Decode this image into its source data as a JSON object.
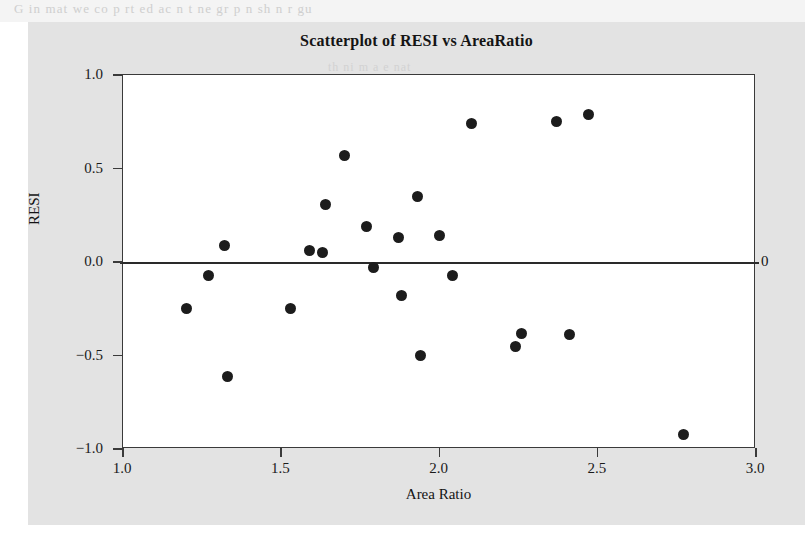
{
  "page": {
    "bleed_text_top": "G  in   mat  we  co  p  rt  ed  ac   n   t  ne  gr  p    n   sh  n   r   gu",
    "panel_ghost_a": "th   ni    m  a   e   nat",
    "panel_ghost_b": "t  h"
  },
  "chart_data": {
    "type": "scatter",
    "title": "Scatterplot of RESI vs AreaRatio",
    "xlabel": "Area Ratio",
    "ylabel": "RESI",
    "xlim": [
      1.0,
      3.0
    ],
    "ylim": [
      -1.0,
      1.0
    ],
    "xticks": [
      1.0,
      1.5,
      2.0,
      2.5,
      3.0
    ],
    "xticklabels": [
      "1.0",
      "1.5",
      "2.0",
      "2.5",
      "3.0"
    ],
    "yticks": [
      1.0,
      0.5,
      0.0,
      -0.5,
      -1.0
    ],
    "yticklabels": [
      "1.0",
      "0.5",
      "0.0",
      "-0.5",
      "-1.0"
    ],
    "grid": false,
    "legend": null,
    "marker_color": "#1c1c1c",
    "marker_size": 11,
    "reference_line": {
      "orientation": "horizontal",
      "y": 0.0,
      "label": "0",
      "label_position": "right",
      "color": "#2a2a2a"
    },
    "points": [
      {
        "x": 1.2,
        "y": -0.25
      },
      {
        "x": 1.27,
        "y": -0.07
      },
      {
        "x": 1.32,
        "y": 0.09
      },
      {
        "x": 1.33,
        "y": -0.61
      },
      {
        "x": 1.53,
        "y": -0.25
      },
      {
        "x": 1.59,
        "y": 0.06
      },
      {
        "x": 1.63,
        "y": 0.05
      },
      {
        "x": 1.64,
        "y": 0.31
      },
      {
        "x": 1.7,
        "y": 0.57
      },
      {
        "x": 1.77,
        "y": 0.19
      },
      {
        "x": 1.79,
        "y": -0.03
      },
      {
        "x": 1.87,
        "y": 0.13
      },
      {
        "x": 1.88,
        "y": -0.18
      },
      {
        "x": 1.93,
        "y": 0.35
      },
      {
        "x": 1.94,
        "y": -0.5
      },
      {
        "x": 2.0,
        "y": 0.14
      },
      {
        "x": 2.04,
        "y": -0.07
      },
      {
        "x": 2.1,
        "y": 0.74
      },
      {
        "x": 2.24,
        "y": -0.45
      },
      {
        "x": 2.26,
        "y": -0.38
      },
      {
        "x": 2.37,
        "y": 0.75
      },
      {
        "x": 2.41,
        "y": -0.39
      },
      {
        "x": 2.47,
        "y": 0.79
      },
      {
        "x": 2.77,
        "y": -0.92
      }
    ]
  }
}
